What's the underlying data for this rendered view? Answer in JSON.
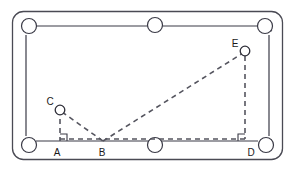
{
  "figure": {
    "type": "geometry-diagram",
    "canvas": {
      "width": 296,
      "height": 171
    },
    "colors": {
      "background": "#ffffff",
      "stroke": "#3a3a46",
      "dashed": "#55555f",
      "label": "#1a1a1a",
      "frame": "#4a4a54"
    },
    "table": {
      "outer_frame": {
        "x": 12,
        "y": 11,
        "width": 271,
        "height": 149,
        "radius": 11
      },
      "rail_left": 36,
      "rail_right": 258,
      "rail_top": 26,
      "rail_bottom": 141
    },
    "pockets": [
      {
        "name": "pocket-top-left",
        "cx": 29,
        "cy": 26,
        "r": 8
      },
      {
        "name": "pocket-top-middle",
        "cx": 155,
        "cy": 25,
        "r": 8
      },
      {
        "name": "pocket-top-right",
        "cx": 265,
        "cy": 26,
        "r": 8
      },
      {
        "name": "pocket-bottom-left",
        "cx": 29,
        "cy": 145,
        "r": 8
      },
      {
        "name": "pocket-bottom-middle",
        "cx": 155,
        "cy": 145,
        "r": 8
      },
      {
        "name": "pocket-bottom-right",
        "cx": 266,
        "cy": 145,
        "r": 8
      }
    ],
    "balls": [
      {
        "name": "ball-c",
        "cx": 60,
        "cy": 110,
        "r": 5
      },
      {
        "name": "ball-e",
        "cx": 245,
        "cy": 51,
        "r": 5
      }
    ],
    "points": [
      {
        "id": "A",
        "x": 60,
        "y": 141,
        "label_x": 57,
        "label_y": 154
      },
      {
        "id": "B",
        "x": 103,
        "y": 141,
        "label_x": 100,
        "label_y": 154
      },
      {
        "id": "C",
        "x": 60,
        "y": 110,
        "label_x": 47,
        "label_y": 106
      },
      {
        "id": "D",
        "x": 245,
        "y": 141,
        "label_x": 248,
        "label_y": 154
      },
      {
        "id": "E",
        "x": 245,
        "y": 51,
        "label_x": 232,
        "label_y": 48
      }
    ],
    "labels": {
      "a": "A",
      "b": "B",
      "c": "C",
      "d": "D",
      "e": "E"
    },
    "segments": [
      {
        "name": "segment-c-to-a",
        "from": "C",
        "to": "A",
        "style": "dashed"
      },
      {
        "name": "segment-c-to-b",
        "from": "C",
        "to": "B",
        "style": "dashed"
      },
      {
        "name": "segment-a-to-d",
        "from": "A",
        "to": "D",
        "style": "dashed"
      },
      {
        "name": "segment-b-to-e",
        "from": "B",
        "to": "E",
        "style": "dashed"
      },
      {
        "name": "segment-e-to-d",
        "from": "E",
        "to": "D",
        "style": "dashed"
      }
    ],
    "right_angles": [
      {
        "name": "right-angle-at-a",
        "x": 60,
        "y": 141,
        "size": 6
      },
      {
        "name": "right-angle-at-d",
        "x": 245,
        "y": 141,
        "size": 6
      }
    ]
  }
}
